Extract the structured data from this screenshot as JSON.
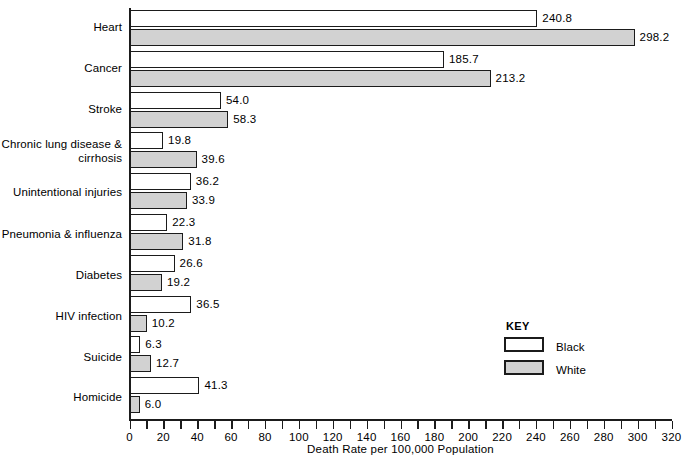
{
  "chart_data": {
    "type": "bar",
    "orientation": "horizontal",
    "title": "",
    "xlabel": "Death Rate per 100,000 Population",
    "ylabel": "",
    "xlim": [
      0,
      320
    ],
    "xticks": [
      0,
      20,
      40,
      60,
      80,
      100,
      120,
      140,
      160,
      180,
      200,
      220,
      240,
      260,
      280,
      300,
      320
    ],
    "xtick_labels": [
      "0",
      "20",
      "40",
      "60",
      "80",
      "100",
      "120",
      "140",
      "160",
      "180",
      "200",
      "220",
      "240",
      "260",
      "280",
      "300",
      "320"
    ],
    "minor_tick_step": 10,
    "grid": false,
    "categories": [
      "Heart",
      "Cancer",
      "Stroke",
      "Chronic lung disease\n& cirrhosis",
      "Unintentional injuries",
      "Pneumonia & influenza",
      "Diabetes",
      "HIV infection",
      "Suicide",
      "Homicide"
    ],
    "series": [
      {
        "name": "Black",
        "fill": "#ffffff",
        "values": [
          240.8,
          185.7,
          54.0,
          19.8,
          36.2,
          22.3,
          26.6,
          36.5,
          6.3,
          41.3
        ],
        "value_labels": [
          "240.8",
          "185.7",
          "54.0",
          "19.8",
          "36.2",
          "22.3",
          "26.6",
          "36.5",
          "6.3",
          "41.3"
        ]
      },
      {
        "name": "White",
        "fill": "#d2d2d2",
        "values": [
          298.2,
          213.2,
          58.3,
          39.6,
          33.9,
          31.8,
          19.2,
          10.2,
          12.7,
          6.0
        ],
        "value_labels": [
          "298.2",
          "213.2",
          "58.3",
          "39.6",
          "33.9",
          "31.8",
          "19.2",
          "10.2",
          "12.7",
          "6.0"
        ]
      }
    ],
    "legend": {
      "title": "KEY",
      "position": "inside-right-lower",
      "entries": [
        {
          "label": "Black",
          "fill": "#ffffff"
        },
        {
          "label": "White",
          "fill": "#d2d2d2"
        }
      ]
    },
    "colors": {
      "outline": "#1b1b1b",
      "black_series_fill": "#ffffff",
      "white_series_fill": "#d2d2d2",
      "background": "#ffffff",
      "text": "#000000"
    }
  }
}
